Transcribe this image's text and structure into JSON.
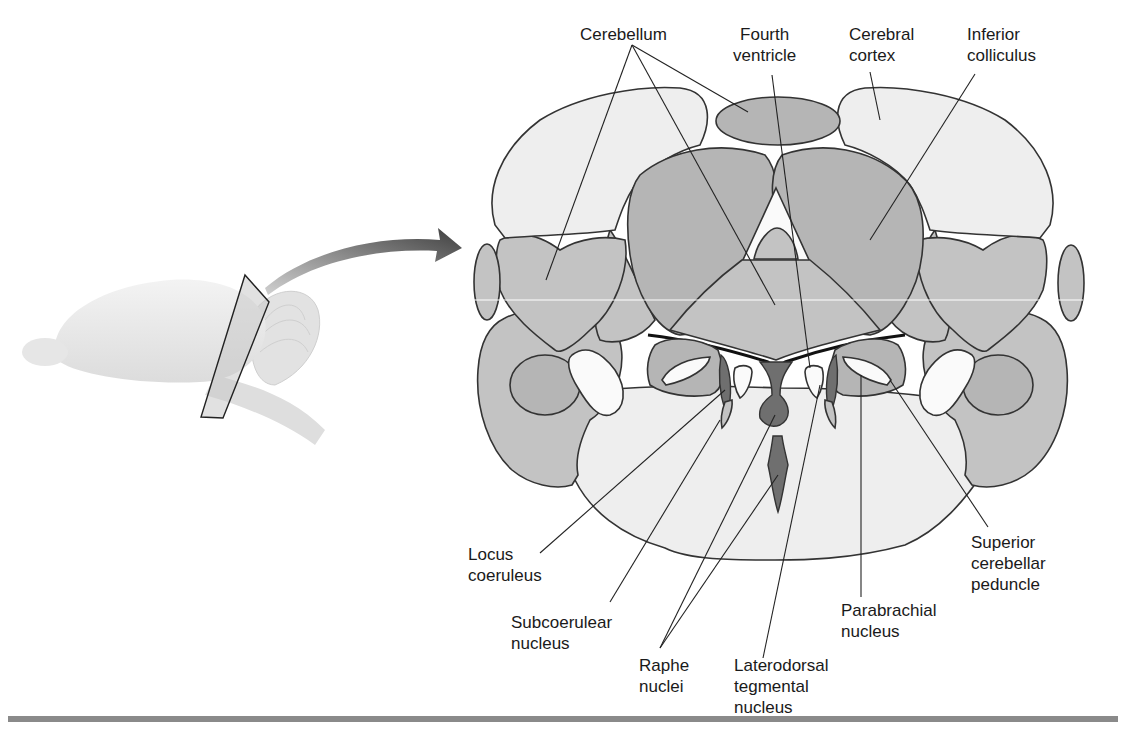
{
  "figure": {
    "type": "anatomical-diagram",
    "colors": {
      "light_fill": "#eeeeee",
      "medium_fill": "#b5b5b5",
      "dark_fill": "#6f6f6f",
      "outline": "#333333",
      "bottom_rule": "#8a8a8a"
    }
  },
  "inset": {
    "description": "Lateral view of brain with section plane",
    "arrow": "curved-arrow-to-section"
  },
  "labels": {
    "cerebellum": "Cerebellum",
    "fourth_ventricle": "Fourth\nventricle",
    "cerebral_cortex": "Cerebral\ncortex",
    "inferior_colliculus": "Inferior\ncolliculus",
    "locus_coeruleus": "Locus\ncoeruleus",
    "subcoerulear_nucleus": "Subcoerulear\nnucleus",
    "raphe_nuclei": "Raphe\nnuclei",
    "laterodorsal_tegmental_nucleus": "Laterodorsal\ntegmental\nnucleus",
    "parabrachial_nucleus": "Parabrachial\nnucleus",
    "superior_cerebellar_peduncle": "Superior\ncerebellar\npeduncle"
  }
}
